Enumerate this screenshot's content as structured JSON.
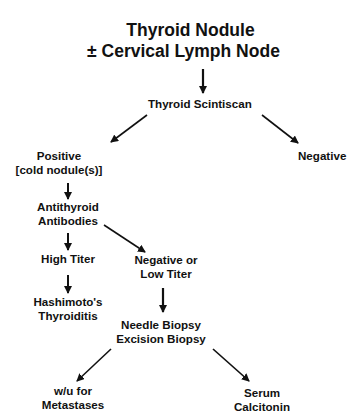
{
  "diagram": {
    "title_line1": "Thyroid Nodule",
    "title_line2": "± Cervical Lymph Node",
    "nodes": {
      "scintiscan": "Thyroid Scintiscan",
      "positive_line1": "Positive",
      "positive_line2": "[cold nodule(s)]",
      "negative": "Negative",
      "antibodies_line1": "Antithyroid",
      "antibodies_line2": "Antibodies",
      "high_titer": "High Titer",
      "neg_low_line1": "Negative or",
      "neg_low_line2": "Low Titer",
      "hashimoto_line1": "Hashimoto's",
      "hashimoto_line2": "Thyroiditis",
      "biopsy_line1": "Needle Biopsy",
      "biopsy_line2": "Excision Biopsy",
      "wu_line1": "w/u for",
      "wu_line2": "Metastases",
      "calcitonin_line1": "Serum",
      "calcitonin_line2": "Calcitonin"
    },
    "edges": [
      [
        "title",
        "scintiscan"
      ],
      [
        "scintiscan",
        "positive"
      ],
      [
        "scintiscan",
        "negative"
      ],
      [
        "positive",
        "antibodies"
      ],
      [
        "antibodies",
        "high_titer"
      ],
      [
        "antibodies",
        "neg_low"
      ],
      [
        "high_titer",
        "hashimoto"
      ],
      [
        "neg_low",
        "biopsy"
      ],
      [
        "biopsy",
        "wu"
      ],
      [
        "biopsy",
        "calcitonin"
      ]
    ],
    "colors": {
      "ink": "#111111",
      "background": "#ffffff"
    }
  }
}
